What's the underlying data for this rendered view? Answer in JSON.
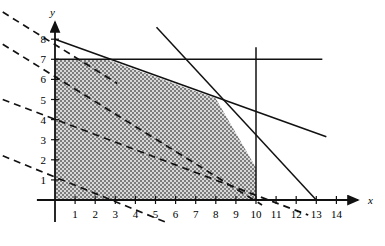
{
  "chart_data": {
    "type": "line",
    "title": "",
    "xlabel": "x",
    "ylabel": "y",
    "xlim": [
      -1,
      15
    ],
    "ylim": [
      -1.2,
      9
    ],
    "grid": false,
    "legend": "none",
    "x_ticks": [
      1,
      2,
      3,
      4,
      5,
      6,
      7,
      8,
      9,
      10,
      11,
      12,
      13,
      14
    ],
    "y_ticks": [
      1,
      2,
      3,
      4,
      5,
      6,
      7,
      8
    ],
    "axis_arrows": [
      "x",
      "y"
    ],
    "shaded_region": {
      "label": "feasible-region",
      "fill": "checkerboard-gray",
      "vertices": [
        [
          0,
          0
        ],
        [
          0,
          7
        ],
        [
          2.55,
          7
        ],
        [
          8.0,
          5.05
        ],
        [
          10,
          1.6
        ],
        [
          10,
          0
        ]
      ]
    },
    "solid_lines": [
      {
        "name": "constraint-shallow",
        "from": [
          0,
          8
        ],
        "to": [
          13.5,
          3.15
        ],
        "note": "passes through (0,8) and about (8,5)"
      },
      {
        "name": "constraint-steep",
        "from": [
          5.05,
          8.6
        ],
        "to": [
          13,
          0
        ],
        "note": "steep boundary hitting x-axis at 13"
      },
      {
        "name": "constraint-horizontal-y7",
        "from": [
          0,
          7
        ],
        "to": [
          13.3,
          7
        ],
        "note": "horizontal line y = 7"
      },
      {
        "name": "constraint-vertical-x10",
        "from": [
          10,
          7.6
        ],
        "to": [
          10,
          0
        ],
        "note": "vertical line x = 10"
      }
    ],
    "dashed_lines": [
      {
        "name": "objective-level-1",
        "from": [
          -2.6,
          9.35
        ],
        "to": [
          3.1,
          5.8
        ]
      },
      {
        "name": "objective-level-2",
        "from": [
          -2.6,
          7.75
        ],
        "to": [
          10.3,
          -0.25
        ]
      },
      {
        "name": "objective-level-3",
        "from": [
          -2.6,
          5.0
        ],
        "to": [
          12.6,
          -0.75
        ]
      },
      {
        "name": "objective-level-4",
        "from": [
          -2.6,
          2.2
        ],
        "to": [
          5.5,
          -1.1
        ]
      }
    ],
    "y_intercepts_of_dashed": [
      8.0,
      6.2,
      3.3,
      0.6
    ]
  },
  "labels": {
    "x_axis": "x",
    "y_axis": "y",
    "x_ticks": [
      "1",
      "2",
      "3",
      "4",
      "5",
      "6",
      "7",
      "8",
      "9",
      "10",
      "11",
      "12",
      "13",
      "14"
    ],
    "y_ticks": [
      "1",
      "2",
      "3",
      "4",
      "5",
      "6",
      "7",
      "8"
    ]
  },
  "colors": {
    "line": "#111111",
    "axis": "#111111",
    "shade_dark": "#6f6f6f",
    "shade_light": "#d8d8d8",
    "background": "#ffffff"
  }
}
